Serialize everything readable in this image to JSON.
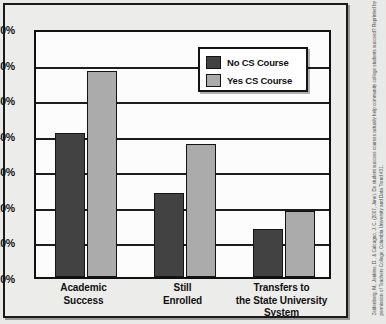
{
  "chart_data": {
    "type": "bar",
    "title": "",
    "xlabel": "",
    "ylabel": "",
    "ylim": [
      0,
      70
    ],
    "grid": true,
    "legend_position": "top-right",
    "categories": [
      "Academic Success",
      "Still Enrolled",
      "Transfers to the State University System"
    ],
    "category_lines": [
      [
        "Academic",
        "Success"
      ],
      [
        "Still",
        "Enrolled"
      ],
      [
        "Transfers to",
        "the State University",
        "System"
      ]
    ],
    "series": [
      {
        "name": "No CS Course",
        "color": "#424242",
        "values": [
          40.5,
          23.5,
          13.5
        ]
      },
      {
        "name": "Yes CS Course",
        "color": "#ababab",
        "values": [
          58.0,
          37.5,
          18.5
        ]
      }
    ],
    "ytick_labels": [
      "70%",
      "60%",
      "50%",
      "40%",
      "30%",
      "20%",
      "10%",
      "0%"
    ],
    "ytick_values": [
      70,
      60,
      50,
      40,
      30,
      20,
      10,
      0
    ]
  },
  "legend": {
    "items": [
      {
        "label": "No CS Course",
        "swatch": "dark"
      },
      {
        "label": "Yes CS Course",
        "swatch": "light"
      }
    ]
  },
  "citation": {
    "text": "Zeidenberg, M., Jenkins, D., & Calcagno, J. C. (2007, June). Do student success courses actually help community college students succeed? Reprinted by permission of Teachers College, Columbia University and Data Trend #31."
  },
  "colors": {
    "no_cs_course": "#424242",
    "yes_cs_course": "#ababab",
    "axis": "#111111",
    "plot_background": "#fcfcfc",
    "page_background": "#e9e9e7"
  }
}
